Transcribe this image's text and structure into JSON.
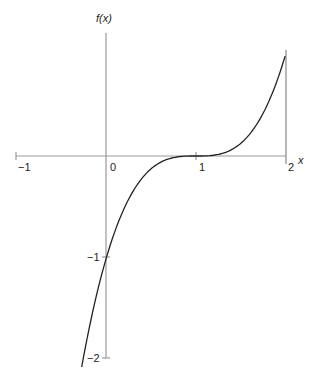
{
  "chart_data": {
    "type": "line",
    "title": "",
    "xlabel": "x",
    "ylabel": "f(x)",
    "function": "(x-1)^3",
    "x_ticks": [
      "-1",
      "0",
      "1",
      "2"
    ],
    "y_ticks": [
      "-1",
      "-2"
    ],
    "xlim": [
      -1,
      2
    ],
    "ylim": [
      -2,
      1
    ],
    "grid": false,
    "series": [
      {
        "name": "f(x)",
        "x": [
          -0.27,
          0,
          0.5,
          1,
          1.5,
          2
        ],
        "y": [
          -2.05,
          -1,
          -0.125,
          0,
          0.125,
          1
        ]
      }
    ],
    "annotations": [
      "vertical line at x = 2"
    ]
  },
  "labels": {
    "ylabel": "f(x)",
    "xlabel": "x",
    "xm1": "−1",
    "x0": "0",
    "x1": "1",
    "x2": "2",
    "ym1": "−1",
    "ym2": "−2"
  }
}
